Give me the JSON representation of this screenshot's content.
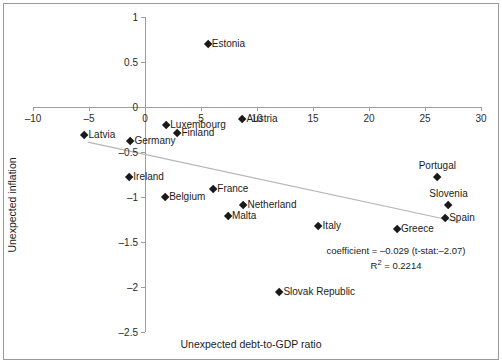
{
  "chart_data": {
    "type": "scatter",
    "title": "",
    "xlabel": "Unexpected debt-to-GDP ratio",
    "ylabel": "Unexpected inflation",
    "xlim": [
      -10,
      30
    ],
    "ylim": [
      -2.5,
      1
    ],
    "xticks": [
      -10,
      -5,
      0,
      5,
      10,
      15,
      20,
      25,
      30
    ],
    "xtick_labels": [
      "-10",
      "-5",
      "0",
      "5",
      "10",
      "15",
      "20",
      "25",
      "30"
    ],
    "yticks": [
      1,
      0.5,
      0,
      -0.5,
      -1,
      -1.5,
      -2,
      -2.5
    ],
    "ytick_labels": [
      "1",
      "0.5",
      "0",
      "-0.5",
      "-1",
      "-1.5",
      "-2",
      "-2.5"
    ],
    "grid": false,
    "legend": null,
    "marker": "diamond",
    "marker_color": "#1a1a1a",
    "points": [
      {
        "label": "Estonia",
        "x": 5.6,
        "y": 0.7,
        "label_pos": "right"
      },
      {
        "label": "Latvia",
        "x": -5.4,
        "y": -0.31,
        "label_pos": "right"
      },
      {
        "label": "Germany",
        "x": -1.3,
        "y": -0.38,
        "label_pos": "right"
      },
      {
        "label": "Luxembourg",
        "x": 1.9,
        "y": -0.2,
        "label_pos": "right"
      },
      {
        "label": "Finland",
        "x": 2.9,
        "y": -0.29,
        "label_pos": "right"
      },
      {
        "label": "Austria",
        "x": 8.7,
        "y": -0.13,
        "label_pos": "right"
      },
      {
        "label": "Ireland",
        "x": -1.4,
        "y": -0.78,
        "label_pos": "right"
      },
      {
        "label": "Belgium",
        "x": 1.8,
        "y": -1.0,
        "label_pos": "right"
      },
      {
        "label": "France",
        "x": 6.1,
        "y": -0.91,
        "label_pos": "right"
      },
      {
        "label": "Netherland",
        "x": 8.8,
        "y": -1.09,
        "label_pos": "right"
      },
      {
        "label": "Malta",
        "x": 7.4,
        "y": -1.21,
        "label_pos": "right"
      },
      {
        "label": "Italy",
        "x": 15.5,
        "y": -1.32,
        "label_pos": "right"
      },
      {
        "label": "Greece",
        "x": 22.5,
        "y": -1.36,
        "label_pos": "right"
      },
      {
        "label": "Portugal",
        "x": 26.1,
        "y": -0.78,
        "label_pos": "above"
      },
      {
        "label": "Slovenia",
        "x": 27.1,
        "y": -1.09,
        "label_pos": "above"
      },
      {
        "label": "Spain",
        "x": 26.8,
        "y": -1.23,
        "label_pos": "right"
      },
      {
        "label": "Slovak Republic",
        "x": 12.0,
        "y": -2.06,
        "label_pos": "right"
      }
    ],
    "trendline": {
      "x_start": -5.1,
      "y_start": -0.39,
      "x_end": 28.1,
      "y_end": -1.28,
      "color": "#b5b5b5"
    },
    "annotations": {
      "coefficient_line": "coefficient = –0.029 (t-stat:–2.07)",
      "r_squared_prefix": "R",
      "r_squared_sup": "2",
      "r_squared_value": " = 0.2214"
    }
  }
}
